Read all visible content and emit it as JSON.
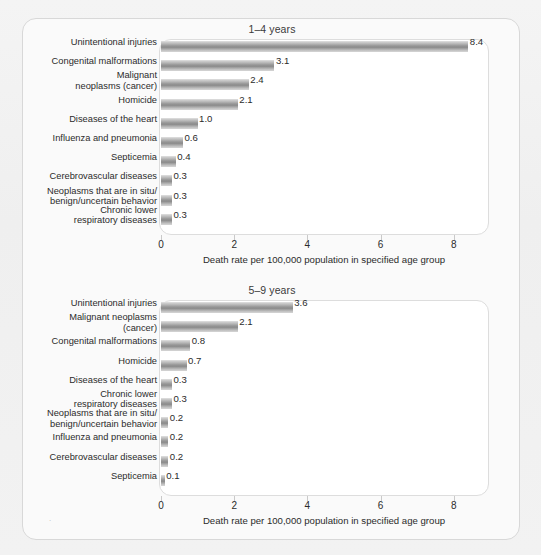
{
  "figure": {
    "axis_title": "Death rate per 100,000 population in specified age group",
    "tick_labels": [
      "0",
      "2",
      "4",
      "6",
      "8"
    ],
    "bar_color": "#949494",
    "panel_bg": "#ffffff",
    "page_bg": "#f1f1f1"
  },
  "chart_data": [
    {
      "type": "bar",
      "title": "1–4 years",
      "orientation": "horizontal",
      "xlabel": "Death rate per 100,000 population in specified age group",
      "ylabel": "",
      "xlim": [
        0,
        8.8
      ],
      "xticks": [
        0,
        2,
        4,
        6,
        8
      ],
      "grid": false,
      "legend": "none",
      "categories": [
        "Unintentional injuries",
        "Congenital malformations",
        "Malignant\nneoplasms (cancer)",
        "Homicide",
        "Diseases of the heart",
        "Influenza and pneumonia",
        "Septicemia",
        "Cerebrovascular diseases",
        "Neoplasms that are in situ/\nbenign/uncertain behavior",
        "Chronic lower\nrespiratory diseases"
      ],
      "values": [
        8.4,
        3.1,
        2.4,
        2.1,
        1.0,
        0.6,
        0.4,
        0.3,
        0.3,
        0.3
      ],
      "value_labels": [
        "8.4",
        "3.1",
        "2.4",
        "2.1",
        "1.0",
        "0.6",
        "0.4",
        "0.3",
        "0.3",
        "0.3"
      ]
    },
    {
      "type": "bar",
      "title": "5–9 years",
      "orientation": "horizontal",
      "xlabel": "Death rate per 100,000 population in specified age group",
      "ylabel": "",
      "xlim": [
        0,
        8.8
      ],
      "xticks": [
        0,
        2,
        4,
        6,
        8
      ],
      "grid": false,
      "legend": "none",
      "categories": [
        "Unintentional injuries",
        "Malignant neoplasms\n(cancer)",
        "Congenital malformations",
        "Homicide",
        "Diseases of the heart",
        "Chronic lower\nrespiratory diseases",
        "Neoplasms that are in situ/\nbenign/uncertain behavior",
        "Influenza and pneumonia",
        "Cerebrovascular diseases",
        "Septicemia"
      ],
      "values": [
        3.6,
        2.1,
        0.8,
        0.7,
        0.3,
        0.3,
        0.2,
        0.2,
        0.2,
        0.1
      ],
      "value_labels": [
        "3.6",
        "2.1",
        "0.8",
        "0.7",
        "0.3",
        "0.3",
        "0.2",
        "0.2",
        "0.2",
        "0.1"
      ]
    }
  ]
}
